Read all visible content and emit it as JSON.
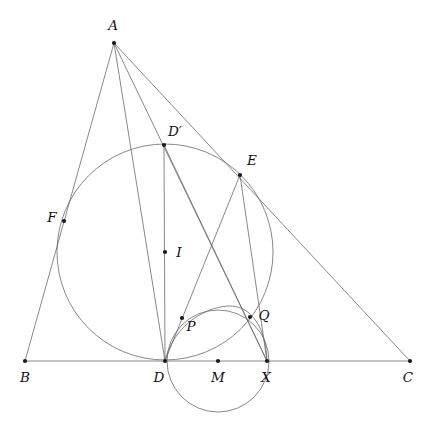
{
  "figure": {
    "type": "euclidean-geometry-diagram",
    "background_color": "#ffffff",
    "stroke_color": "#6a6a6a",
    "point_color": "#1a1a1a",
    "label_color": "#111111",
    "canvas": {
      "width": 432,
      "height": 430
    }
  },
  "points": [
    {
      "id": "A",
      "label": "A",
      "x": 114,
      "y": 43,
      "lx": 113,
      "ly": 30,
      "anchor": "middle"
    },
    {
      "id": "B",
      "label": "B",
      "x": 25,
      "y": 361,
      "lx": 25,
      "ly": 382,
      "anchor": "middle"
    },
    {
      "id": "C",
      "label": "C",
      "x": 410,
      "y": 361,
      "lx": 408,
      "ly": 382,
      "anchor": "middle"
    },
    {
      "id": "D",
      "label": "D",
      "x": 165,
      "y": 361,
      "lx": 159,
      "ly": 382,
      "anchor": "middle"
    },
    {
      "id": "Dp",
      "label": "D′",
      "x": 164,
      "y": 145,
      "lx": 175,
      "ly": 136,
      "anchor": "middle"
    },
    {
      "id": "E",
      "label": "E",
      "x": 240,
      "y": 175,
      "lx": 252,
      "ly": 165,
      "anchor": "middle"
    },
    {
      "id": "F",
      "label": "F",
      "x": 64,
      "y": 221,
      "lx": 52,
      "ly": 222,
      "anchor": "middle"
    },
    {
      "id": "I",
      "label": "I",
      "x": 165,
      "y": 252,
      "lx": 179,
      "ly": 257,
      "anchor": "middle"
    },
    {
      "id": "P",
      "label": "P",
      "x": 182,
      "y": 318,
      "lx": 191,
      "ly": 331,
      "anchor": "middle"
    },
    {
      "id": "Q",
      "label": "Q",
      "x": 250,
      "y": 317,
      "lx": 264,
      "ly": 320,
      "anchor": "middle"
    },
    {
      "id": "M",
      "label": "M",
      "x": 218,
      "y": 361,
      "lx": 218,
      "ly": 382,
      "anchor": "middle"
    },
    {
      "id": "X",
      "label": "X",
      "x": 267,
      "y": 361,
      "lx": 266,
      "ly": 382,
      "anchor": "middle"
    }
  ],
  "segments": [
    {
      "id": "side-AB",
      "name": "segment-AB",
      "x1": 114,
      "y1": 43,
      "x2": 25,
      "y2": 361
    },
    {
      "id": "side-BC",
      "name": "segment-BC",
      "x1": 25,
      "y1": 361,
      "x2": 410,
      "y2": 361
    },
    {
      "id": "side-AC",
      "name": "segment-AC",
      "x1": 114,
      "y1": 43,
      "x2": 410,
      "y2": 361
    },
    {
      "id": "cev-ADp",
      "name": "segment-A-to-D",
      "x1": 114,
      "y1": 43,
      "x2": 165,
      "y2": 361
    },
    {
      "id": "cev-AX",
      "name": "segment-A-to-X",
      "x1": 114,
      "y1": 43,
      "x2": 267,
      "y2": 361
    },
    {
      "id": "diam-DpD",
      "name": "segment-Dprime-to-D",
      "x1": 164,
      "y1": 145,
      "x2": 165,
      "y2": 361
    },
    {
      "id": "ch-DpX",
      "name": "segment-Dprime-to-X",
      "x1": 164,
      "y1": 145,
      "x2": 267,
      "y2": 361
    },
    {
      "id": "ch-ED",
      "name": "segment-E-to-D",
      "x1": 240,
      "y1": 175,
      "x2": 165,
      "y2": 361
    },
    {
      "id": "ch-EX",
      "name": "segment-E-to-X",
      "x1": 240,
      "y1": 175,
      "x2": 267,
      "y2": 361
    }
  ],
  "circles": [
    {
      "id": "incircle",
      "name": "incircle-center-I",
      "cx": 165,
      "cy": 252,
      "r": 108
    },
    {
      "id": "smallcircle",
      "name": "circle-center-M",
      "cx": 218,
      "cy": 361,
      "r": 51
    }
  ],
  "arcs": [
    {
      "id": "arc-D-P-Q-X",
      "name": "arc-through-P-and-Q",
      "d": "M 165 361 C 172 330 200 308 228 306 C 252 305 266 329 267 361"
    }
  ]
}
